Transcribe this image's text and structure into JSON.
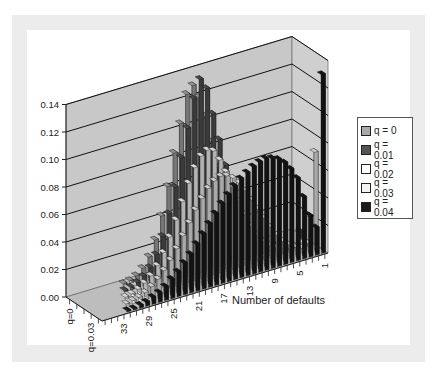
{
  "chart_data": {
    "type": "bar",
    "subtype": "3d-column",
    "title": "",
    "xlabel": "Number of defaults",
    "ylabel": "",
    "ylim": [
      0,
      0.14
    ],
    "y_ticks": [
      "0.00",
      "0.02",
      "0.04",
      "0.06",
      "0.08",
      "0.10",
      "0.12",
      "0.14"
    ],
    "x_tick_labels": [
      "33",
      "29",
      "25",
      "21",
      "17",
      "13",
      "9",
      "5",
      "1"
    ],
    "depth_tick_labels": [
      "q=0",
      "q=0.03"
    ],
    "categories": [
      36,
      35,
      34,
      33,
      32,
      31,
      30,
      29,
      28,
      27,
      26,
      25,
      24,
      23,
      22,
      21,
      20,
      19,
      18,
      17,
      16,
      15,
      14,
      13,
      12,
      11,
      10,
      9,
      8,
      7,
      6,
      5,
      4,
      3,
      2,
      1
    ],
    "legend_position": "right",
    "grid": true,
    "series": [
      {
        "name": "q = 0",
        "color": "#a9a9a9",
        "values": [
          0,
          0,
          0,
          0,
          0,
          0,
          0,
          0,
          0.001,
          0.002,
          0.004,
          0.008,
          0.015,
          0.026,
          0.042,
          0.062,
          0.085,
          0.105,
          0.125,
          0.13,
          0.12,
          0.105,
          0.085,
          0.065,
          0.045,
          0.03,
          0.018,
          0.01,
          0.005,
          0.002,
          0.001,
          0,
          0,
          0,
          0,
          0
        ]
      },
      {
        "name": "q = 0.01",
        "color": "#555555",
        "values": [
          0,
          0,
          0,
          0,
          0,
          0,
          0,
          0.001,
          0.002,
          0.004,
          0.007,
          0.012,
          0.02,
          0.032,
          0.047,
          0.065,
          0.085,
          0.105,
          0.125,
          0.138,
          0.13,
          0.11,
          0.09,
          0.07,
          0.05,
          0.034,
          0.021,
          0.012,
          0.006,
          0.003,
          0.001,
          0.001,
          0,
          0,
          0,
          0.005
        ]
      },
      {
        "name": "q = 0.02",
        "color": "#ffffff",
        "values": [
          0,
          0,
          0,
          0,
          0,
          0,
          0.001,
          0.002,
          0.004,
          0.007,
          0.011,
          0.017,
          0.025,
          0.035,
          0.046,
          0.058,
          0.07,
          0.08,
          0.087,
          0.09,
          0.088,
          0.08,
          0.07,
          0.058,
          0.046,
          0.035,
          0.025,
          0.017,
          0.011,
          0.007,
          0.004,
          0.002,
          0.001,
          0.001,
          0.002,
          0.02
        ]
      },
      {
        "name": "q = 0.03",
        "color": "#f2f2f2",
        "values": [
          0,
          0,
          0,
          0,
          0,
          0.001,
          0.002,
          0.003,
          0.005,
          0.008,
          0.012,
          0.017,
          0.023,
          0.03,
          0.038,
          0.046,
          0.054,
          0.061,
          0.067,
          0.071,
          0.073,
          0.072,
          0.069,
          0.064,
          0.057,
          0.049,
          0.041,
          0.033,
          0.025,
          0.018,
          0.012,
          0.008,
          0.005,
          0.003,
          0.005,
          0.07
        ]
      },
      {
        "name": "q = 0.04",
        "color": "#1a1a1a",
        "values": [
          0,
          0,
          0,
          0,
          0.001,
          0.001,
          0.002,
          0.003,
          0.005,
          0.007,
          0.01,
          0.014,
          0.018,
          0.023,
          0.028,
          0.034,
          0.04,
          0.046,
          0.052,
          0.058,
          0.063,
          0.068,
          0.072,
          0.075,
          0.078,
          0.08,
          0.081,
          0.08,
          0.078,
          0.074,
          0.068,
          0.06,
          0.045,
          0.03,
          0.02,
          0.13
        ]
      }
    ]
  },
  "legend": {
    "items": [
      {
        "label": "q = 0",
        "color": "#a9a9a9"
      },
      {
        "label": "q = 0.01",
        "color": "#555555"
      },
      {
        "label": "q = 0.02",
        "color": "#ffffff"
      },
      {
        "label": "q = 0.03",
        "color": "#f2f2f2"
      },
      {
        "label": "q = 0.04",
        "color": "#1a1a1a"
      }
    ]
  }
}
